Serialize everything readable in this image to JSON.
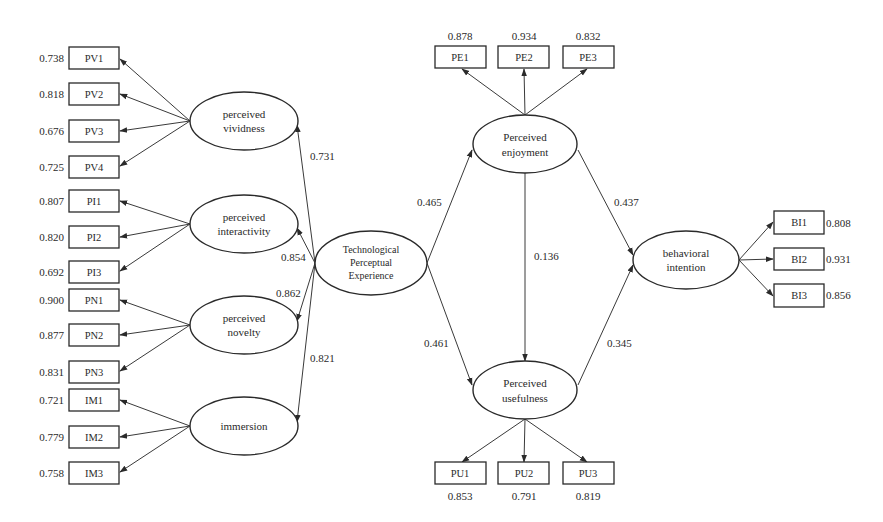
{
  "diagram": {
    "type": "structural-equation-model",
    "latent_variables": [
      {
        "id": "PV",
        "label_line1": "perceived",
        "label_line2": "vividness",
        "cx": 244,
        "cy": 121,
        "rx": 54,
        "ry": 29
      },
      {
        "id": "PI",
        "label_line1": "perceived",
        "label_line2": "interactivity",
        "cx": 244,
        "cy": 224,
        "rx": 54,
        "ry": 29
      },
      {
        "id": "PN",
        "label_line1": "perceived",
        "label_line2": "novelty",
        "cx": 244,
        "cy": 325,
        "rx": 54,
        "ry": 29
      },
      {
        "id": "IM",
        "label_line1": "immersion",
        "label_line2": "",
        "cx": 244,
        "cy": 426,
        "rx": 54,
        "ry": 29
      },
      {
        "id": "TPE",
        "label_line1": "Technological",
        "label_line2": "Perceptual",
        "label_line3": "Experience",
        "cx": 371,
        "cy": 263,
        "rx": 56,
        "ry": 32
      },
      {
        "id": "PE",
        "label_line1": "Perceived",
        "label_line2": "enjoyment",
        "cx": 525,
        "cy": 144,
        "rx": 52,
        "ry": 29
      },
      {
        "id": "PU",
        "label_line1": "Perceived",
        "label_line2": "usefulness",
        "cx": 525,
        "cy": 390,
        "rx": 52,
        "ry": 29
      },
      {
        "id": "BI",
        "label_line1": "behavioral",
        "label_line2": "intention",
        "cx": 686,
        "cy": 260,
        "rx": 53,
        "ry": 29
      }
    ],
    "indicators": {
      "PV": [
        {
          "label": "PV1",
          "loading": "0.738"
        },
        {
          "label": "PV2",
          "loading": "0.818"
        },
        {
          "label": "PV3",
          "loading": "0.676"
        },
        {
          "label": "PV4",
          "loading": "0.725"
        }
      ],
      "PI": [
        {
          "label": "PI1",
          "loading": "0.807"
        },
        {
          "label": "PI2",
          "loading": "0.820"
        },
        {
          "label": "PI3",
          "loading": "0.692"
        }
      ],
      "PN": [
        {
          "label": "PN1",
          "loading": "0.900"
        },
        {
          "label": "PN2",
          "loading": "0.877"
        },
        {
          "label": "PN3",
          "loading": "0.831"
        }
      ],
      "IM": [
        {
          "label": "IM1",
          "loading": "0.721"
        },
        {
          "label": "IM2",
          "loading": "0.779"
        },
        {
          "label": "IM3",
          "loading": "0.758"
        }
      ],
      "PE": [
        {
          "label": "PE1",
          "loading": "0.878"
        },
        {
          "label": "PE2",
          "loading": "0.934"
        },
        {
          "label": "PE3",
          "loading": "0.832"
        }
      ],
      "PU": [
        {
          "label": "PU1",
          "loading": "0.853"
        },
        {
          "label": "PU2",
          "loading": "0.791"
        },
        {
          "label": "PU3",
          "loading": "0.819"
        }
      ],
      "BI": [
        {
          "label": "BI1",
          "loading": "0.808"
        },
        {
          "label": "BI2",
          "loading": "0.931"
        },
        {
          "label": "BI3",
          "loading": "0.856"
        }
      ]
    },
    "paths": [
      {
        "from": "TPE",
        "to": "PV",
        "coef": "0.731"
      },
      {
        "from": "TPE",
        "to": "PI",
        "coef": "0.854"
      },
      {
        "from": "TPE",
        "to": "PN",
        "coef": "0.862"
      },
      {
        "from": "TPE",
        "to": "IM",
        "coef": "0.821"
      },
      {
        "from": "TPE",
        "to": "PE",
        "coef": "0.465"
      },
      {
        "from": "TPE",
        "to": "PU",
        "coef": "0.461"
      },
      {
        "from": "PE",
        "to": "PU",
        "coef": "0.136"
      },
      {
        "from": "PE",
        "to": "BI",
        "coef": "0.437"
      },
      {
        "from": "PU",
        "to": "BI",
        "coef": "0.345"
      }
    ]
  }
}
